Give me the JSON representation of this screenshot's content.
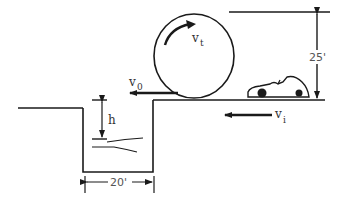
{
  "diagram": {
    "labels": {
      "vt": "v",
      "vt_sub": "t",
      "v0": "v",
      "v0_sub": "0",
      "vi": "v",
      "vi_sub": "i",
      "h": "h",
      "height_dim": "25'",
      "width_dim": "20'"
    },
    "colors": {
      "stroke": "#1a1a1a",
      "background": "#ffffff"
    },
    "elements": [
      "loop (circle) with rotation arrow v_t",
      "car on upper level moving left with velocity v_i",
      "launch velocity v_0 at loop exit",
      "25 ft height dimension",
      "pit 20 ft wide with water at depth h"
    ]
  }
}
